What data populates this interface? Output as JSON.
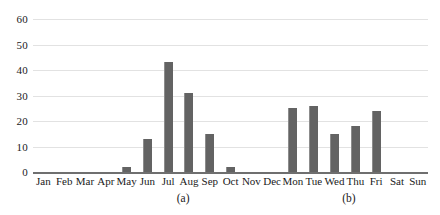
{
  "chart_data": {
    "type": "bar",
    "title": "",
    "xlabel": "",
    "ylabel": "",
    "ylim": [
      0,
      60
    ],
    "yticks": [
      0,
      10,
      20,
      30,
      40,
      50,
      60
    ],
    "grid": true,
    "legend": false,
    "bar_color": "#636363",
    "gridline_color": "#e2e2e2",
    "axis_color": "#6f6f6f",
    "categories": [
      "Jan",
      "Feb",
      "Mar",
      "Apr",
      "May",
      "Jun",
      "Jul",
      "Aug",
      "Sep",
      "Oct",
      "Nov",
      "Dec",
      "Mon",
      "Tue",
      "Wed",
      "Thu",
      "Fri",
      "Sat",
      "Sun"
    ],
    "values": [
      0,
      0,
      0,
      0,
      2,
      13,
      43,
      31,
      15,
      2,
      0,
      0,
      25,
      26,
      15,
      18,
      24,
      0,
      0
    ],
    "groups": [
      {
        "caption": "(a)",
        "categories": [
          "Jan",
          "Feb",
          "Mar",
          "Apr",
          "May",
          "Jun",
          "Jul",
          "Aug",
          "Sep",
          "Oct",
          "Nov",
          "Dec"
        ],
        "values": [
          0,
          0,
          0,
          0,
          2,
          13,
          43,
          31,
          15,
          2,
          0,
          0
        ]
      },
      {
        "caption": "(b)",
        "categories": [
          "Mon",
          "Tue",
          "Wed",
          "Thu",
          "Fri",
          "Sat",
          "Sun"
        ],
        "values": [
          25,
          26,
          15,
          18,
          24,
          0,
          0
        ]
      }
    ],
    "captions": [
      {
        "label": "(a)",
        "center_pct": 38
      },
      {
        "label": "(b)",
        "center_pct": 80
      }
    ]
  }
}
